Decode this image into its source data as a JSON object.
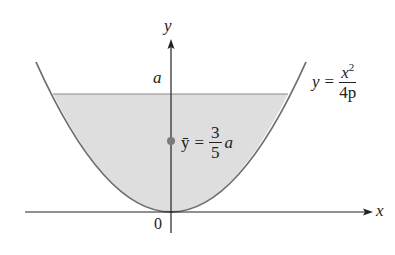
{
  "figure": {
    "axis_labels": {
      "x": "x",
      "y": "y"
    },
    "origin_label": "0",
    "height_label": "a",
    "curve_equation": {
      "lhs": "y",
      "equals": "=",
      "numerator": "x",
      "numerator_superscript": "2",
      "denominator": "4p"
    },
    "centroid_equation": {
      "lhs": "ȳ",
      "equals": "=",
      "numerator": "3",
      "denominator": "5",
      "suffix": "a"
    },
    "colors": {
      "fill": "#dedede",
      "curve": "#6e6e6e",
      "axis": "#222222",
      "centroid_point": "#7a7a7a",
      "fill_top_line": "#8a8a8a"
    }
  }
}
